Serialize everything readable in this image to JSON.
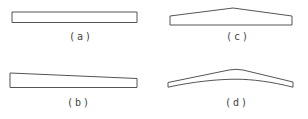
{
  "figure": {
    "background": "#ffffff",
    "line_color": "#555555",
    "label_color": "#3f3f3f",
    "panels": [
      {
        "id": "a",
        "label": "(a)",
        "shape_name": "uniform-rectangular-bar",
        "path": "M12,12 L137,12 L137,22.5 L12,22.5 Z"
      },
      {
        "id": "b",
        "label": "(b)",
        "shape_name": "tapered-bar",
        "path": "M10,73 L137,78.5 L137,87.5 L10,87.5 Z"
      },
      {
        "id": "c",
        "label": "(c)",
        "shape_name": "double-tapered-peaked-bar",
        "path": "M170,16 L233,8 L292,16 L292,25 L170,25 Z"
      },
      {
        "id": "d",
        "label": "(d)",
        "shape_name": "curved-cambered-bar",
        "path": "M168,82.5 L229,70 Q236,68.6 243,70 L293,82 L293,87.2 C272,81.8 252,79.2 236,79.2 C218,79.2 192,81.8 168,87.2 Z"
      }
    ]
  }
}
